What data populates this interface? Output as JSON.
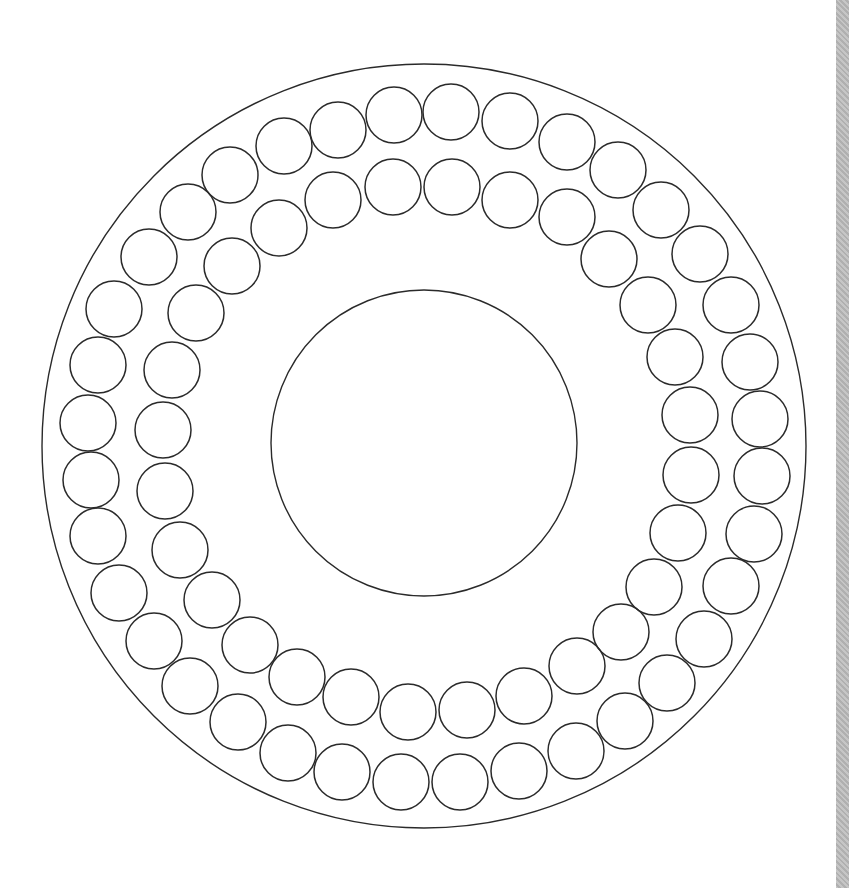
{
  "diagram": {
    "stroke_color": "#2a2a2a",
    "background": "#ffffff",
    "edge_strip_color": "#b9b9b9",
    "outer_ring": {
      "cx": 424,
      "cy": 446,
      "r": 382
    },
    "center_circle": {
      "cx": 424,
      "cy": 443,
      "r": 153
    },
    "small_circle_radius": 28,
    "outer_row_circles": [
      [
        394,
        115
      ],
      [
        451,
        112
      ],
      [
        510,
        121
      ],
      [
        567,
        142
      ],
      [
        618,
        170
      ],
      [
        661,
        210
      ],
      [
        700,
        254
      ],
      [
        731,
        305
      ],
      [
        750,
        362
      ],
      [
        760,
        419
      ],
      [
        762,
        476
      ],
      [
        754,
        534
      ],
      [
        731,
        586
      ],
      [
        704,
        639
      ],
      [
        667,
        683
      ],
      [
        625,
        721
      ],
      [
        576,
        751
      ],
      [
        519,
        771
      ],
      [
        460,
        782
      ],
      [
        401,
        782
      ],
      [
        342,
        772
      ],
      [
        288,
        753
      ],
      [
        238,
        722
      ],
      [
        190,
        686
      ],
      [
        154,
        641
      ],
      [
        119,
        593
      ],
      [
        98,
        536
      ],
      [
        91,
        480
      ],
      [
        88,
        423
      ],
      [
        98,
        365
      ],
      [
        114,
        309
      ],
      [
        149,
        257
      ],
      [
        188,
        212
      ],
      [
        230,
        175
      ],
      [
        284,
        146
      ],
      [
        338,
        130
      ]
    ],
    "inner_row_circles": [
      [
        393,
        187
      ],
      [
        452,
        187
      ],
      [
        510,
        200
      ],
      [
        567,
        217
      ],
      [
        609,
        259
      ],
      [
        648,
        305
      ],
      [
        675,
        357
      ],
      [
        690,
        415
      ],
      [
        691,
        475
      ],
      [
        678,
        533
      ],
      [
        654,
        587
      ],
      [
        621,
        632
      ],
      [
        577,
        666
      ],
      [
        524,
        696
      ],
      [
        467,
        710
      ],
      [
        408,
        712
      ],
      [
        351,
        697
      ],
      [
        297,
        677
      ],
      [
        250,
        645
      ],
      [
        212,
        600
      ],
      [
        180,
        550
      ],
      [
        165,
        491
      ],
      [
        163,
        430
      ],
      [
        172,
        370
      ],
      [
        196,
        313
      ],
      [
        232,
        266
      ],
      [
        279,
        228
      ],
      [
        333,
        200
      ]
    ]
  }
}
